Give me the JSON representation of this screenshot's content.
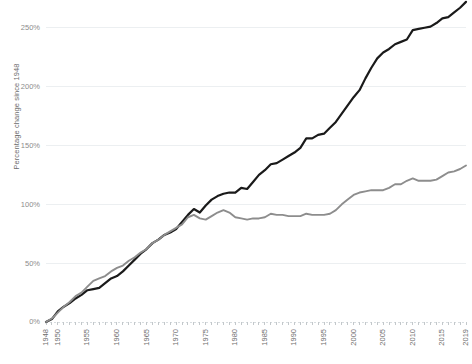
{
  "chart_data": {
    "type": "line",
    "title": "",
    "subtitle": "",
    "xlabel": "",
    "ylabel": "Percentage change since 1948",
    "xlim": [
      1948,
      2019
    ],
    "ylim": [
      0,
      260
    ],
    "grid": true,
    "legend_position": "none",
    "y_ticks": [
      0,
      50,
      100,
      150,
      200,
      250
    ],
    "y_tick_labels": [
      "0%",
      "50%",
      "100%",
      "150%",
      "200%",
      "250%"
    ],
    "x_ticks": [
      1948,
      1950,
      1955,
      1960,
      1965,
      1970,
      1975,
      1980,
      1985,
      1990,
      1995,
      2000,
      2005,
      2010,
      2015,
      2019
    ],
    "x_tick_labels": [
      "1948",
      "1950",
      "1955",
      "1960",
      "1965",
      "1970",
      "1975",
      "1980",
      "1985",
      "1990",
      "1995",
      "2000",
      "2005",
      "2010",
      "2015",
      "2019"
    ],
    "colors": {
      "productivity": "#1a1a1a",
      "compensation": "#8d8d8d",
      "gridline": "#eceff1",
      "axis_text": "#6d6d6d",
      "background": "#ffffff"
    },
    "x": [
      1948,
      1949,
      1950,
      1951,
      1952,
      1953,
      1954,
      1955,
      1956,
      1957,
      1958,
      1959,
      1960,
      1961,
      1962,
      1963,
      1964,
      1965,
      1966,
      1967,
      1968,
      1969,
      1970,
      1971,
      1972,
      1973,
      1974,
      1975,
      1976,
      1977,
      1978,
      1979,
      1980,
      1981,
      1982,
      1983,
      1984,
      1985,
      1986,
      1987,
      1988,
      1989,
      1990,
      1991,
      1992,
      1993,
      1994,
      1995,
      1996,
      1997,
      1998,
      1999,
      2000,
      2001,
      2002,
      2003,
      2004,
      2005,
      2006,
      2007,
      2008,
      2009,
      2010,
      2011,
      2012,
      2013,
      2014,
      2015,
      2016,
      2017,
      2018,
      2019
    ],
    "series": [
      {
        "name": "productivity",
        "label": "Productivity",
        "color": "#1a1a1a",
        "linewidth": 2.2,
        "values": [
          0,
          2.5,
          9,
          13,
          16,
          20,
          23,
          27,
          28,
          29,
          33,
          37,
          39,
          43,
          48,
          53,
          58,
          62,
          67,
          70,
          74,
          76,
          79,
          85,
          91,
          96,
          93,
          99,
          104,
          107,
          109,
          110,
          110,
          114,
          113,
          119,
          125,
          129,
          134,
          135,
          138,
          141,
          144,
          148,
          156,
          156,
          159,
          160,
          165,
          170,
          177,
          184,
          191,
          197,
          207,
          216,
          224,
          229,
          232,
          236,
          238,
          240,
          248,
          249,
          250,
          251,
          254,
          258,
          259,
          263,
          267,
          272
        ]
      },
      {
        "name": "compensation",
        "label": "Hourly compensation",
        "color": "#8d8d8d",
        "linewidth": 1.9,
        "values": [
          0,
          3,
          8,
          13,
          17,
          22,
          25,
          30,
          35,
          37,
          39,
          43,
          46,
          48,
          52,
          55,
          59,
          62,
          67,
          70,
          74,
          77,
          80,
          83,
          89,
          91,
          88,
          87,
          90,
          93,
          95,
          93,
          89,
          88,
          87,
          88,
          88,
          89,
          92,
          91,
          91,
          90,
          90,
          90,
          92,
          91,
          91,
          91,
          92,
          95,
          100,
          104,
          108,
          110,
          111,
          112,
          112,
          112,
          114,
          117,
          117,
          120,
          122,
          120,
          120,
          120,
          121,
          124,
          127,
          128,
          130,
          133
        ]
      }
    ]
  }
}
